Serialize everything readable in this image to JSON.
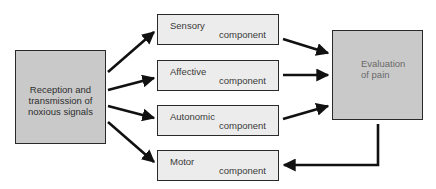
{
  "diagram": {
    "source": {
      "label_lines": [
        "Reception and",
        "transmission of",
        "noxious signals"
      ]
    },
    "components": [
      {
        "name": "Sensory",
        "suffix": "component"
      },
      {
        "name": "Affective",
        "suffix": "component"
      },
      {
        "name": "Autonomic",
        "suffix": "component"
      },
      {
        "name": "Motor",
        "suffix": "component"
      }
    ],
    "target": {
      "label_lines": [
        "Evaluation",
        "of pain"
      ]
    },
    "colors": {
      "source_fill": "#c9c9c9",
      "component_fill": "#ececec",
      "target_fill": "#c9c9c9",
      "stroke": "#1a1a1a"
    },
    "edges": [
      {
        "from": "source",
        "to": "Sensory"
      },
      {
        "from": "source",
        "to": "Affective"
      },
      {
        "from": "source",
        "to": "Autonomic"
      },
      {
        "from": "source",
        "to": "Motor"
      },
      {
        "from": "Sensory",
        "to": "target"
      },
      {
        "from": "Affective",
        "to": "target"
      },
      {
        "from": "Autonomic",
        "to": "target"
      },
      {
        "from": "target",
        "to": "Motor"
      }
    ]
  }
}
